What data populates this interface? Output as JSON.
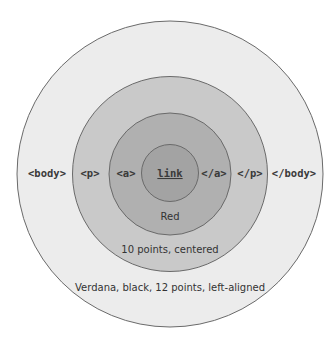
{
  "diagram": {
    "rings": [
      {
        "name": "body",
        "open_tag": "<body>",
        "close_tag": "</body>",
        "caption": "Verdana, black, 12 points, left-aligned",
        "fill": "#ececec"
      },
      {
        "name": "p",
        "open_tag": "<p>",
        "close_tag": "</p>",
        "caption": "10 points, centered",
        "fill": "#c9c9c9"
      },
      {
        "name": "a",
        "open_tag": "<a>",
        "close_tag": "</a>",
        "caption": "Red",
        "fill": "#b0b0b0"
      },
      {
        "name": "link",
        "text": "link",
        "fill": "#a3a3a3"
      }
    ],
    "stroke": "#6a6a6a"
  }
}
